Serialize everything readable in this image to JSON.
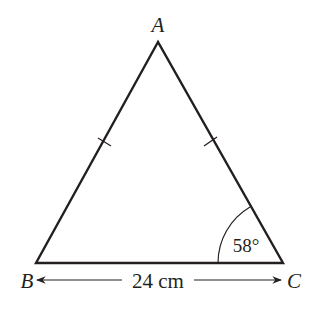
{
  "diagram": {
    "type": "isosceles-triangle",
    "vertices": {
      "A": {
        "label": "A"
      },
      "B": {
        "label": "B"
      },
      "C": {
        "label": "C"
      }
    },
    "base_length_label": "24 cm",
    "angle_C_label": "58°",
    "equal_sides": [
      "AB",
      "AC"
    ],
    "colors": {
      "stroke": "#231f20",
      "background": "#ffffff"
    }
  }
}
